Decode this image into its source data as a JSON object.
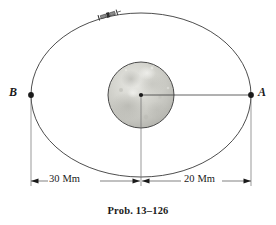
{
  "figure": {
    "caption": "Prob. 13–126",
    "background_color": "#ffffff",
    "line_color": "#333333"
  },
  "orbit": {
    "name": "elliptical-orbit-path",
    "center_x": 141,
    "center_y": 95,
    "semi_major_axis_px": 110,
    "semi_minor_axis_px": 82
  },
  "moon": {
    "name": "moon",
    "label": "moon",
    "center_x": 141,
    "center_y": 95,
    "radius_px": 33,
    "fill_color": "#c9c9c4",
    "edge_color": "#4a4a4a"
  },
  "satellite": {
    "name": "satellite",
    "label": "satellite",
    "x": 108,
    "y": 15
  },
  "points": [
    {
      "id": "B",
      "label": "B",
      "x": 31,
      "y": 95,
      "role": "apoapsis"
    },
    {
      "id": "A",
      "label": "A",
      "x": 251,
      "y": 95,
      "role": "periapsis"
    },
    {
      "id": "O",
      "label": "",
      "x": 141,
      "y": 95,
      "role": "moon-center"
    }
  ],
  "dimensions": [
    {
      "id": "left",
      "label": "30 Mm",
      "value": 30,
      "unit": "Mm",
      "from": "B",
      "to": "O",
      "x_start": 31,
      "x_end": 141,
      "y": 181
    },
    {
      "id": "right",
      "label": "20 Mm",
      "value": 20,
      "unit": "Mm",
      "from": "O",
      "to": "A",
      "x_start": 141,
      "x_end": 251,
      "y": 181
    }
  ]
}
